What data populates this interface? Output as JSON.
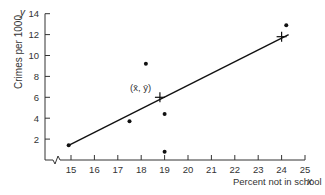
{
  "chart_data": {
    "type": "scatter",
    "title": "",
    "xlabel": "Percent not in school",
    "xlabel_var": "x",
    "ylabel": "Crimes per 1000",
    "ylabel_var": "y",
    "xlim": [
      14,
      25
    ],
    "ylim": [
      0,
      14
    ],
    "x_ticks": [
      15,
      16,
      17,
      18,
      19,
      20,
      21,
      22,
      23,
      24,
      25
    ],
    "y_ticks": [
      2,
      4,
      6,
      8,
      10,
      12,
      14
    ],
    "x_axis_break": true,
    "grid": false,
    "legend": null,
    "points": [
      {
        "x": 14.9,
        "y": 1.4
      },
      {
        "x": 17.5,
        "y": 3.7
      },
      {
        "x": 18.2,
        "y": 9.2
      },
      {
        "x": 19.0,
        "y": 4.4
      },
      {
        "x": 19.0,
        "y": 0.8
      },
      {
        "x": 24.2,
        "y": 12.9
      }
    ],
    "regression_line": {
      "x1": 14.9,
      "y1": 1.4,
      "x2": 24.3,
      "y2": 12.0
    },
    "markers": [
      {
        "type": "plus",
        "x": 18.8,
        "y": 6.0,
        "label": "(x̄, ȳ)"
      },
      {
        "type": "plus",
        "x": 24.0,
        "y": 11.8,
        "label": ""
      }
    ],
    "annotations": [
      {
        "text": "(x̄, ȳ)",
        "x": 17.8,
        "y": 6.9
      }
    ]
  },
  "axes": {
    "x_label": "Percent not in school",
    "x_var": "x",
    "y_label": "Crimes per 1000",
    "y_var": "y"
  },
  "mean_label": "(x̄, ȳ)"
}
